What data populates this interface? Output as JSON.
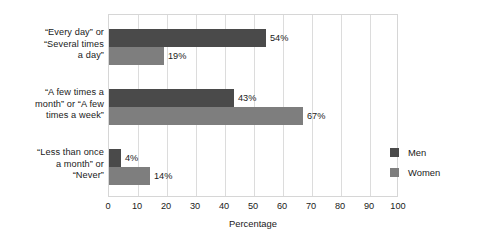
{
  "chart_data": {
    "type": "bar",
    "orientation": "horizontal",
    "title": "",
    "xlabel": "Percentage",
    "ylabel": "",
    "xlim": [
      0,
      100
    ],
    "xticks": [
      0,
      10,
      20,
      30,
      40,
      50,
      60,
      70,
      80,
      90,
      100
    ],
    "xtick_labels": [
      "0",
      "10",
      "20",
      "30",
      "40",
      "50",
      "60",
      "70",
      "80",
      "90",
      "100"
    ],
    "grid": true,
    "grid_axis": "x",
    "legend_position": "inside-right",
    "categories": [
      "“Every day” or “Several times a day”",
      "“A few times a month” or “A few times a week”",
      "“Less than once a month” or “Never”"
    ],
    "category_label_lines": [
      [
        "“Every day” or",
        "“Several times",
        "a day”"
      ],
      [
        "“A few times a",
        "month” or “A few",
        "times a week”"
      ],
      [
        "“Less than once",
        "a month” or",
        "“Never”"
      ]
    ],
    "series": [
      {
        "name": "Men",
        "color": "#4a4a4a",
        "values": [
          54,
          43,
          4
        ],
        "value_labels": [
          "54%",
          "43%",
          "4%"
        ]
      },
      {
        "name": "Women",
        "color": "#7e7e7e",
        "values": [
          19,
          67,
          14
        ],
        "value_labels": [
          "19%",
          "67%",
          "14%"
        ]
      }
    ]
  },
  "legend": {
    "items": [
      {
        "label": "Men",
        "color": "#4a4a4a"
      },
      {
        "label": "Women",
        "color": "#7e7e7e"
      }
    ]
  },
  "axis": {
    "x_title": "Percentage"
  },
  "colors": {
    "men": "#4a4a4a",
    "women": "#7e7e7e",
    "grid": "#dcdcdc",
    "frame": "#d6d6d6",
    "text": "#1a1a1a",
    "background": "#ffffff"
  }
}
